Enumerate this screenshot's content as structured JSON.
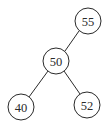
{
  "diagram": {
    "type": "binary-search-tree",
    "nodes": [
      {
        "id": "n55",
        "label": "55",
        "cx": 88,
        "cy": 21
      },
      {
        "id": "n50",
        "label": "50",
        "cx": 56,
        "cy": 61
      },
      {
        "id": "n40",
        "label": "40",
        "cx": 21,
        "cy": 107
      },
      {
        "id": "n52",
        "label": "52",
        "cx": 87,
        "cy": 105
      }
    ],
    "edges": [
      {
        "from": "n55",
        "to": "n50"
      },
      {
        "from": "n50",
        "to": "n40"
      },
      {
        "from": "n50",
        "to": "n52"
      }
    ],
    "node_radius": 13,
    "colors": {
      "stroke": "#2a2a2a",
      "fill": "#ffffff",
      "text": "#2a2a2a"
    }
  }
}
